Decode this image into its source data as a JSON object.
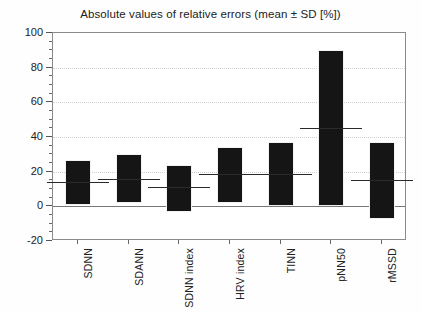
{
  "chart_data": {
    "type": "bar",
    "title": "Absolute values of relative errors (mean ± SD [%])",
    "xlabel": "",
    "ylabel": "",
    "ylim": [
      -20,
      100
    ],
    "yticks": [
      -20,
      0,
      20,
      40,
      60,
      80,
      100
    ],
    "ytick_labels": [
      "-20",
      "0",
      "20",
      "40",
      "60",
      "80",
      "100"
    ],
    "minor_tick_step": 5,
    "grid": "horizontal-dotted-major",
    "legend": "none",
    "categories": [
      "SDNN",
      "SDANN",
      "SDNN index",
      "HRV index",
      "TINN",
      "pNN50",
      "rMSSD"
    ],
    "series": [
      {
        "name": "mean",
        "values": [
          14,
          16,
          11,
          18.5,
          18.5,
          45,
          15
        ]
      },
      {
        "name": "mean_plus_sd",
        "values": [
          27,
          30,
          24,
          34,
          37,
          90,
          37
        ]
      },
      {
        "name": "mean_minus_sd",
        "values": [
          1,
          2,
          -3,
          2,
          0,
          0,
          -7.5
        ]
      }
    ],
    "bar_color": "#151515",
    "mean_line_color": "#2a2a2a",
    "grid_color": "#cfcfcf",
    "axis_color": "#8a8a8a",
    "background_color": "#ffffff"
  },
  "axes": {
    "y_labels": [
      "100",
      "80",
      "60",
      "40",
      "20",
      "0",
      "-20"
    ]
  },
  "bars": [
    {
      "label": "SDNN",
      "top": 27,
      "bottom": 1,
      "mean": 14
    },
    {
      "label": "SDANN",
      "top": 30,
      "bottom": 2,
      "mean": 16
    },
    {
      "label": "SDNN index",
      "top": 24,
      "bottom": -3,
      "mean": 11
    },
    {
      "label": "HRV index",
      "top": 34,
      "bottom": 2,
      "mean": 18.5
    },
    {
      "label": "TINN",
      "top": 37,
      "bottom": 0,
      "mean": 18.5
    },
    {
      "label": "pNN50",
      "top": 90,
      "bottom": 0,
      "mean": 45
    },
    {
      "label": "rMSSD",
      "top": 37,
      "bottom": -7.5,
      "mean": 15
    }
  ]
}
